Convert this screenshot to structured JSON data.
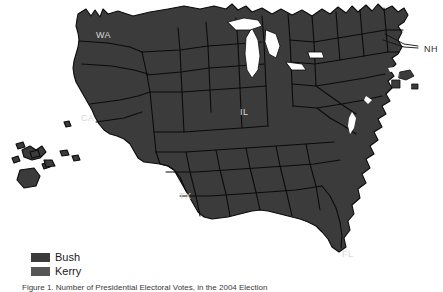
{
  "figure": {
    "caption": "Figure 1. Number of Presidential Electoral Votes, in the 2004 Election",
    "colors": {
      "bush": "#3b3b3b",
      "kerry": "#565656",
      "background": "#ffffff",
      "border": "#0b0b0b",
      "label_text": "#d8d8d8",
      "outside_label_text": "#2f2f2f"
    }
  },
  "legend": {
    "items": [
      {
        "label": "Bush",
        "color": "#3b3b3b"
      },
      {
        "label": "Kerry",
        "color": "#565656"
      }
    ]
  },
  "map": {
    "type": "cartogram",
    "state_labels": [
      {
        "code": "WA",
        "x": 96,
        "y": 31,
        "outside": false
      },
      {
        "code": "CA",
        "x": 81,
        "y": 114,
        "outside": false
      },
      {
        "code": "IL",
        "x": 240,
        "y": 108,
        "outside": false
      },
      {
        "code": "TX",
        "x": 179,
        "y": 192,
        "outside": false
      },
      {
        "code": "FL",
        "x": 342,
        "y": 250,
        "outside": false
      },
      {
        "code": "NH",
        "x": 424,
        "y": 45,
        "outside": true
      }
    ]
  }
}
